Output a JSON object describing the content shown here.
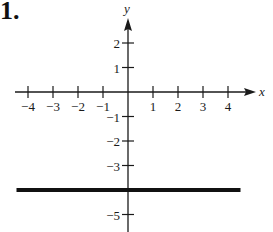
{
  "problem_label": "1.",
  "chart_data": {
    "type": "line",
    "title": "",
    "xlabel": "x",
    "ylabel": "y",
    "x_ticks": [
      -4,
      -3,
      -2,
      -1,
      1,
      2,
      3,
      4
    ],
    "x_tick_labels": [
      "−4",
      "−3",
      "−2",
      "−1",
      "1",
      "2",
      "3",
      "4"
    ],
    "y_ticks": [
      2,
      1,
      -1,
      -2,
      -3,
      -5
    ],
    "y_tick_labels": [
      "2",
      "1",
      "−1",
      "−2",
      "−3",
      "−5"
    ],
    "xlim": [
      -4.5,
      5
    ],
    "ylim": [
      -5.5,
      3.5
    ],
    "grid": false,
    "series": [
      {
        "name": "y = -4",
        "x": [
          -4.5,
          4.5
        ],
        "y": [
          -4,
          -4
        ],
        "color": "#111111",
        "line_width": 4
      }
    ]
  },
  "colors": {
    "axis": "#1a1a1a",
    "line": "#111111",
    "background": "#ffffff"
  }
}
